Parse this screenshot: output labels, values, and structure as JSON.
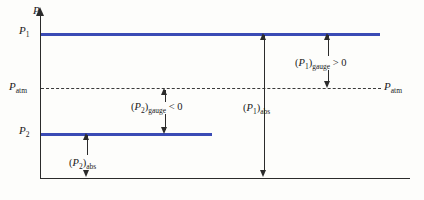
{
  "figure": {
    "type": "pressure-diagram"
  },
  "axes": {
    "y_axis_label": "P",
    "x_axis_label": ""
  },
  "levels": {
    "p1_label_base": "P",
    "p1_label_sub": "1",
    "p2_label_base": "P",
    "p2_label_sub": "2",
    "patm_label_base": "P",
    "patm_label_sub": "atm",
    "patm_right_base": "P",
    "patm_right_sub": "atm"
  },
  "annotations": {
    "p1_gauge": "(P₁)gauge > 0",
    "p2_gauge": "(P₂)gauge < 0",
    "p1_abs": "(P₁)abs",
    "p2_abs": "(P₂)abs"
  },
  "chart_data": {
    "type": "line",
    "title": "",
    "xlabel": "",
    "ylabel": "P",
    "grid": false,
    "legend": "none",
    "series": [
      {
        "name": "P1",
        "kind": "horizontal-level",
        "value": 1.0,
        "color": "#3a4bb5",
        "x_extent": [
          0.0,
          0.92
        ]
      },
      {
        "name": "P2",
        "kind": "horizontal-level",
        "value": 0.27,
        "color": "#3a4bb5",
        "x_extent": [
          0.0,
          0.47
        ]
      },
      {
        "name": "Patm",
        "kind": "horizontal-level-dashed",
        "value": 0.55,
        "color": "#3a3a3a",
        "x_extent": [
          0.0,
          0.92
        ]
      }
    ],
    "measurements": [
      {
        "name": "(P1)gauge",
        "from": "Patm",
        "to": "P1",
        "sign": "> 0"
      },
      {
        "name": "(P2)gauge",
        "from": "Patm",
        "to": "P2",
        "sign": "< 0"
      },
      {
        "name": "(P1)abs",
        "from": "zero",
        "to": "P1",
        "sign": ""
      },
      {
        "name": "(P2)abs",
        "from": "zero",
        "to": "P2",
        "sign": ""
      }
    ],
    "ylim": [
      0,
      1.15
    ]
  },
  "colors": {
    "pressure_line": "#3a4bb5",
    "axis": "#2b2b2b",
    "atm_dash": "#3a3a3a",
    "background": "#fdfdfb"
  }
}
